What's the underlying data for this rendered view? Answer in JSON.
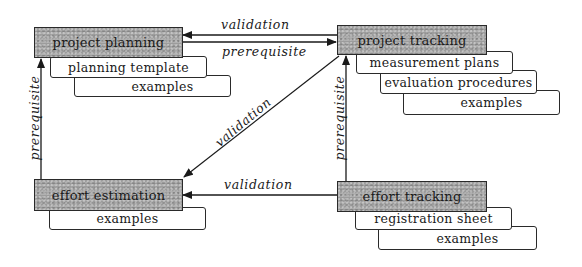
{
  "diagram": {
    "nodes": {
      "project_planning": {
        "label": "project planning",
        "documents": [
          "planning template",
          "examples"
        ]
      },
      "project_tracking": {
        "label": "project tracking",
        "documents": [
          "measurement plans",
          "evaluation procedures",
          "examples"
        ]
      },
      "effort_estimation": {
        "label": "effort estimation",
        "documents": [
          "examples"
        ]
      },
      "effort_tracking": {
        "label": "effort tracking",
        "documents": [
          "registration sheet",
          "examples"
        ]
      }
    },
    "edges": [
      {
        "from": "project_tracking",
        "to": "project_planning",
        "label": "validation"
      },
      {
        "from": "project_planning",
        "to": "project_tracking",
        "label": "prerequisite"
      },
      {
        "from": "effort_estimation",
        "to": "project_planning",
        "label": "prerequisite"
      },
      {
        "from": "project_tracking",
        "to": "effort_estimation",
        "label": "validation"
      },
      {
        "from": "effort_tracking",
        "to": "project_tracking",
        "label": "prerequisite"
      },
      {
        "from": "effort_tracking",
        "to": "effort_estimation",
        "label": "validation"
      }
    ],
    "colors": {
      "node_fill": "#9c9c9c",
      "stroke": "#2a2a2a",
      "doc_fill": "#ffffff"
    }
  }
}
